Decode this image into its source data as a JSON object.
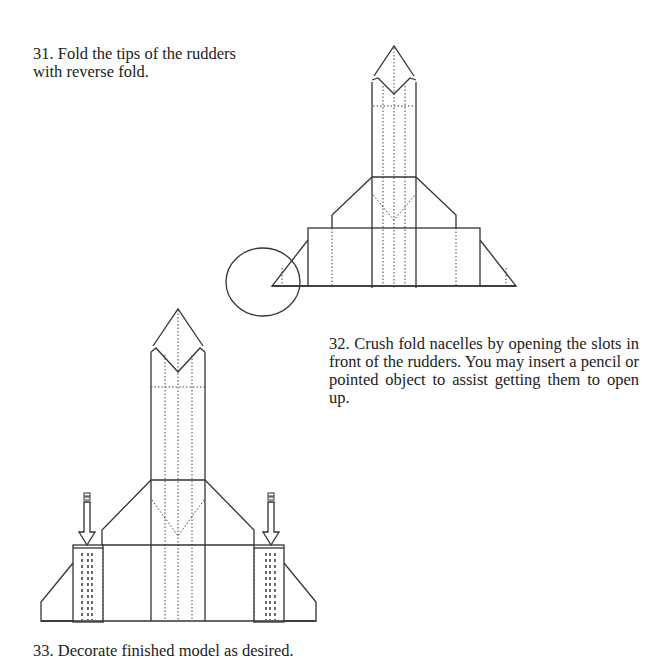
{
  "steps": [
    {
      "number": "31",
      "text": "31. Fold the tips of the rudders with reverse fold."
    },
    {
      "number": "32",
      "text": "32. Crush fold nacelles by opening the slots in front of the rudders. You may insert a pencil or pointed object to assist getting them to open up."
    },
    {
      "number": "33",
      "text": "33. Decorate finished model as desired."
    }
  ],
  "figures": [
    {
      "id": "figure-31",
      "description": "Origami spaceship diagram with circled left rudder tip indicating reverse fold"
    },
    {
      "id": "figure-32",
      "description": "Origami spaceship diagram with two down arrows pointing into nacelle slots"
    }
  ]
}
